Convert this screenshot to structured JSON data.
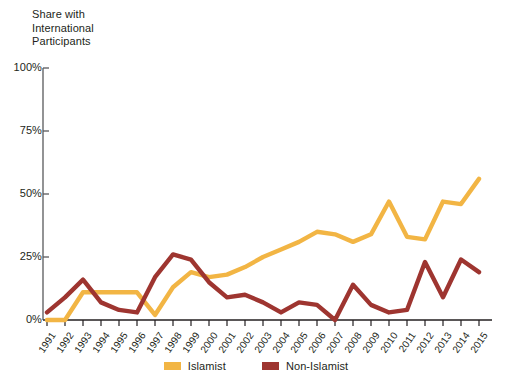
{
  "chart_data": {
    "type": "line",
    "title": "",
    "ylabel": "Share with\nInternational\nParticipants",
    "xlabel": "",
    "ylim": [
      0,
      100
    ],
    "yticks": [
      0,
      25,
      50,
      75,
      100
    ],
    "ytick_labels": [
      "0%",
      "25%",
      "50%",
      "75%",
      "100%"
    ],
    "grid": false,
    "legend_position": "bottom-center",
    "categories": [
      "1991",
      "1992",
      "1993",
      "1994",
      "1995",
      "1996",
      "1997",
      "1998",
      "1999",
      "2000",
      "2001",
      "2002",
      "2003",
      "2004",
      "2005",
      "2006",
      "2007",
      "2008",
      "2009",
      "2010",
      "2011",
      "2012",
      "2013",
      "2014",
      "2015"
    ],
    "series": [
      {
        "name": "Islamist",
        "color": "#F2B544",
        "values": [
          0,
          0,
          11,
          11,
          11,
          11,
          2,
          13,
          19,
          17,
          18,
          21,
          25,
          28,
          31,
          35,
          34,
          31,
          34,
          47,
          33,
          32,
          47,
          46,
          56
        ]
      },
      {
        "name": "Non-Islamist",
        "color": "#9E3530",
        "values": [
          3,
          9,
          16,
          7,
          4,
          3,
          17,
          26,
          24,
          15,
          9,
          10,
          7,
          3,
          7,
          6,
          0,
          14,
          6,
          3,
          4,
          23,
          9,
          24,
          19
        ]
      }
    ]
  },
  "legend": {
    "items": [
      {
        "label": "Islamist",
        "color": "#F2B544"
      },
      {
        "label": "Non-Islamist",
        "color": "#9E3530"
      }
    ]
  }
}
